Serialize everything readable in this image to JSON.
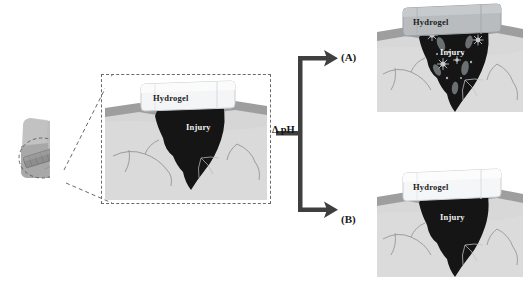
{
  "figure": {
    "type": "scientific-schematic",
    "background_color": "#ffffff"
  },
  "body_site": {
    "name": "limb-with-dressing",
    "skin_color": "#b9b9b9",
    "skin_shadow_color": "#a0a0a0",
    "dressing_color": "#8e8e8e",
    "callout_circle_color": "#5a5a5a"
  },
  "zoom_link": {
    "name": "magnification-leader-lines",
    "style": "dashed",
    "color": "#6b6b6b"
  },
  "center_panel": {
    "name": "wound-cross-section",
    "frame_style": "dashed",
    "frame_color": "#6b6b6b",
    "hydrogel_label": "Hydrogel",
    "injury_label": "Injury",
    "hydrogel_color": "#f4f5f6",
    "hydrogel_edge_color": "#c9cccd",
    "epidermis_color": "#9e9e9e",
    "dermis_color": "#d6d6d6",
    "injury_color": "#151515",
    "vessel_color": "#8d8d8d"
  },
  "transition": {
    "name": "ph-trigger",
    "label": "Δ pH",
    "arrow_color": "#3f3f3f",
    "branch_a_label": "(A)",
    "branch_b_label": "(B)"
  },
  "panel_a": {
    "name": "outcome-panel-a",
    "hydrogel_label": "Hydrogel",
    "injury_label": "Injury",
    "hydrogel_color": "#b8bcbe",
    "hydrogel_edge_color": "#9aa0a2",
    "epidermis_color": "#9e9e9e",
    "dermis_color": "#d8d8d8",
    "injury_color": "#151515",
    "vessel_color": "#8d8d8d",
    "release_state": "drug released into wound",
    "capsule_color": "#6f7577",
    "burst_color": "#cfd3d5"
  },
  "panel_b": {
    "name": "outcome-panel-b",
    "hydrogel_label": "Hydrogel",
    "injury_label": "Injury",
    "hydrogel_color": "#f5f6f7",
    "hydrogel_edge_color": "#cccfd0",
    "epidermis_color": "#9e9e9e",
    "dermis_color": "#d8d8d8",
    "injury_color": "#151515",
    "vessel_color": "#8d8d8d",
    "release_state": "hydrogel intact, no release"
  }
}
